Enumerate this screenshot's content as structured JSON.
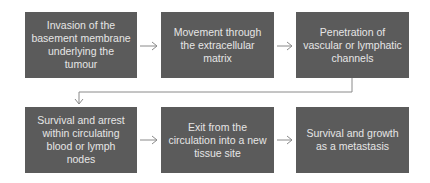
{
  "diagram": {
    "type": "flowchart",
    "colors": {
      "box_fill": "#5b5b5b",
      "box_text": "#e6e6e6",
      "arrow": "#8a8a8a"
    },
    "steps": [
      {
        "label": "Invasion of the basement membrane underlying the tumour"
      },
      {
        "label": "Movement through the extracellular matrix"
      },
      {
        "label": "Penetration of vascular or lymphatic channels"
      },
      {
        "label": "Survival and arrest within circulating blood or lymph nodes"
      },
      {
        "label": "Exit from the circulation into a new tissue site"
      },
      {
        "label": "Survival and growth as a metastasis"
      }
    ],
    "edges": [
      {
        "from": 0,
        "to": 1
      },
      {
        "from": 1,
        "to": 2
      },
      {
        "from": 2,
        "to": 3
      },
      {
        "from": 3,
        "to": 4
      },
      {
        "from": 4,
        "to": 5
      }
    ]
  }
}
